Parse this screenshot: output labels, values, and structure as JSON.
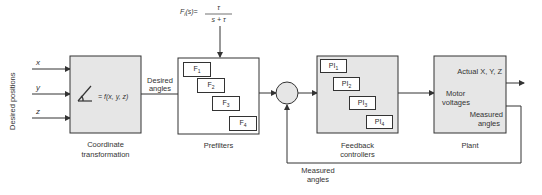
{
  "diagram": {
    "inputs": {
      "group_label": "Desired positions",
      "x": "x",
      "y": "y",
      "z": "z"
    },
    "coordinate_block": {
      "equation": "= f(x, y, z)",
      "caption_line1": "Coordinate",
      "caption_line2": "transformation"
    },
    "desired_angles_label": {
      "line1": "Desired",
      "line2": "angles"
    },
    "prefilter_transfer_function": {
      "lhs": "F",
      "lhs_sub": "i",
      "lhs_arg": "(s)=",
      "numerator": "τ",
      "denominator": "s + τ"
    },
    "prefilters": {
      "caption": "Prefilters",
      "items": [
        {
          "label": "F",
          "sub": "1"
        },
        {
          "label": "F",
          "sub": "2"
        },
        {
          "label": "F",
          "sub": "3"
        },
        {
          "label": "F",
          "sub": "4"
        }
      ]
    },
    "feedback_controllers": {
      "caption_line1": "Feedback",
      "caption_line2": "controllers",
      "items": [
        {
          "label": "PI",
          "sub": "1"
        },
        {
          "label": "PI",
          "sub": "2"
        },
        {
          "label": "PI",
          "sub": "3"
        },
        {
          "label": "PI",
          "sub": "4"
        }
      ]
    },
    "plant": {
      "caption": "Plant",
      "output_label": "Actual X, Y, Z",
      "input_label_line1": "Motor",
      "input_label_line2": "voltages",
      "feedback_label_line1": "Measured",
      "feedback_label_line2": "angles"
    },
    "feedback_path_label": {
      "line1": "Measured",
      "line2": "angles"
    },
    "colors": {
      "block_fill": "#e6e6e6",
      "line": "#333333",
      "white_fill": "#ffffff"
    }
  }
}
